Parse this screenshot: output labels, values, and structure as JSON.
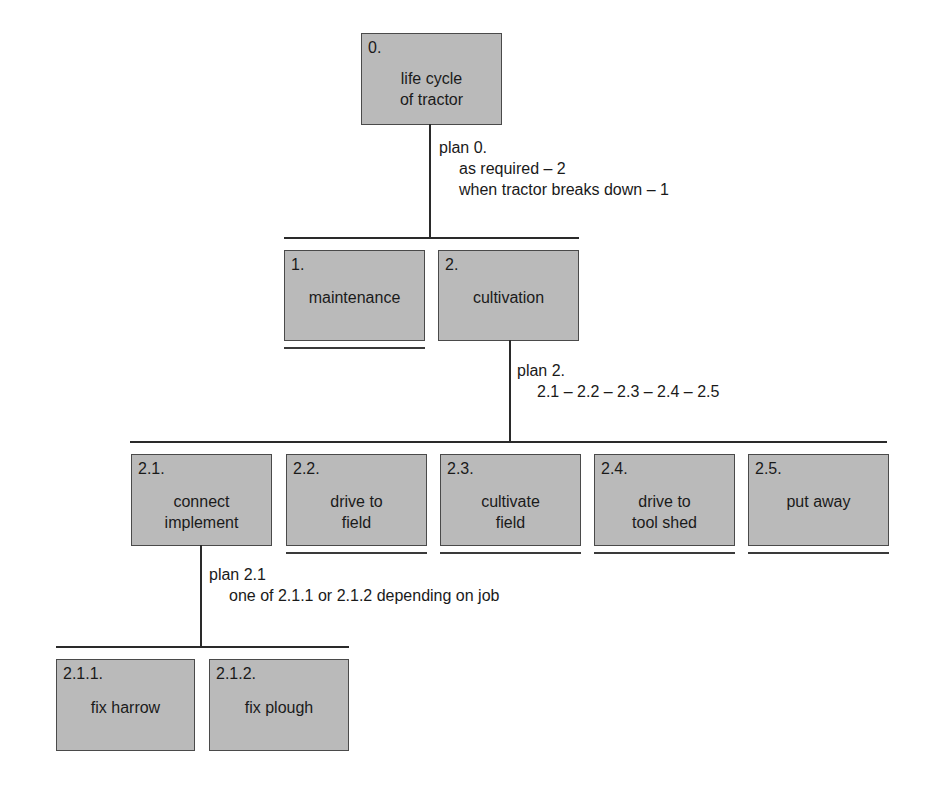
{
  "diagram": {
    "colors": {
      "box_fill": "#bababa",
      "box_border": "#4a4a4a",
      "line": "#2a2a2a"
    },
    "nodes": {
      "n0": {
        "num": "0.",
        "label": "life cycle\nof tractor"
      },
      "n1": {
        "num": "1.",
        "label": "maintenance"
      },
      "n2": {
        "num": "2.",
        "label": "cultivation"
      },
      "n21": {
        "num": "2.1.",
        "label": "connect\nimplement"
      },
      "n22": {
        "num": "2.2.",
        "label": "drive to\nfield"
      },
      "n23": {
        "num": "2.3.",
        "label": "cultivate\nfield"
      },
      "n24": {
        "num": "2.4.",
        "label": "drive to\ntool shed"
      },
      "n25": {
        "num": "2.5.",
        "label": "put away"
      },
      "n211": {
        "num": "2.1.1.",
        "label": "fix harrow"
      },
      "n212": {
        "num": "2.1.2.",
        "label": "fix plough"
      }
    },
    "plans": {
      "p0": {
        "title": "plan 0.",
        "lines": [
          "as required – 2",
          "when tractor breaks down – 1"
        ]
      },
      "p2": {
        "title": "plan 2.",
        "lines": [
          "2.1 – 2.2 – 2.3 – 2.4 – 2.5"
        ]
      },
      "p21": {
        "title": "plan 2.1",
        "lines": [
          "one of 2.1.1 or 2.1.2 depending on job"
        ]
      }
    }
  }
}
